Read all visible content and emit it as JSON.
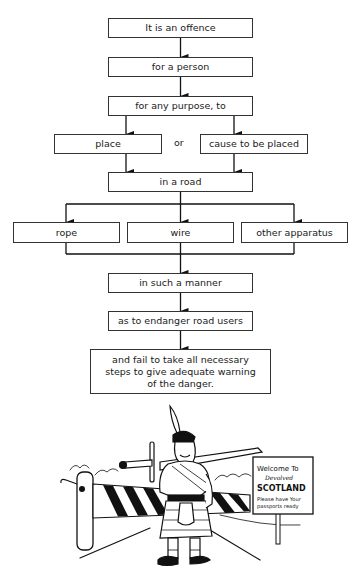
{
  "flowchart": {
    "step1": "It is an offence",
    "step2": "for a person",
    "step3": "for any purpose, to",
    "option_left": "place",
    "option_connector": "or",
    "option_right": "cause to be placed",
    "step4": "in a road",
    "items": [
      "rope",
      "wire",
      "other apparatus"
    ],
    "step5": "in such a manner",
    "step6": "as to endanger road users",
    "step7": "and fail to take all necessary steps to give adequate warning of the danger."
  },
  "illustration": {
    "description": "Cartoon Highlander with claymore sword standing in front of a striped road barrier",
    "sign": {
      "line1": "Welcome To",
      "line2": "Devolved",
      "line3": "SCOTLAND",
      "line4": "Please have Your",
      "line5": "passports ready"
    }
  }
}
